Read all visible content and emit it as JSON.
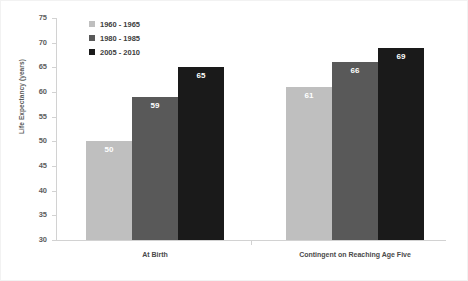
{
  "chart_data": {
    "type": "bar",
    "title": "",
    "xlabel": "",
    "ylabel": "Life Expectancy (years)",
    "ylim": [
      30,
      75
    ],
    "yticks": [
      30,
      35,
      40,
      45,
      50,
      55,
      60,
      65,
      70,
      75
    ],
    "grid": false,
    "legend_position": "top-left-inside",
    "categories": [
      "At Birth",
      "Contingent on Reaching Age Five"
    ],
    "series": [
      {
        "name": "1960 - 1965",
        "color": "#bfbfbf",
        "values": [
          50,
          61
        ]
      },
      {
        "name": "1980 - 1985",
        "color": "#595959",
        "values": [
          59,
          66
        ]
      },
      {
        "name": "2005 - 2010",
        "color": "#1a1a1a",
        "values": [
          65,
          69
        ]
      }
    ]
  }
}
